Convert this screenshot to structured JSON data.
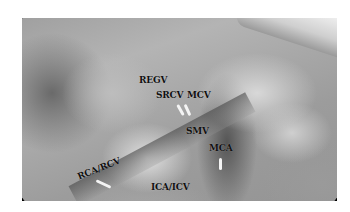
{
  "image": {
    "description": "Grayscale laparoscopic view of right colectomy vascular anatomy around the superior mesenteric vein",
    "labels": [
      {
        "text": "REGV",
        "x": 139,
        "y": 80
      },
      {
        "text": "SRCV",
        "x": 156,
        "y": 95
      },
      {
        "text": "MCV",
        "x": 187,
        "y": 95
      },
      {
        "text": "SMV",
        "x": 186,
        "y": 130
      },
      {
        "text": "MCA",
        "x": 209,
        "y": 147
      },
      {
        "text": "RCA/RCV",
        "x": 80,
        "y": 176,
        "rotate": -22
      },
      {
        "text": "ICA/ICV",
        "x": 151,
        "y": 186
      }
    ]
  }
}
